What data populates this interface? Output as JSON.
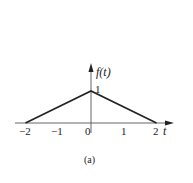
{
  "chart_data": {
    "type": "line",
    "title": "",
    "caption": "(a)",
    "xlabel": "t",
    "ylabel": "f(t)",
    "x": [
      -2,
      0,
      2
    ],
    "y": [
      0,
      1,
      0
    ],
    "series": [
      {
        "name": "f(t)",
        "x": [
          -2,
          0,
          2
        ],
        "y": [
          0,
          1,
          0
        ]
      }
    ],
    "x_ticks": [
      "-2",
      "-1",
      "0",
      "1",
      "2"
    ],
    "y_ticks": [
      "1"
    ],
    "xlim": [
      -2,
      2
    ],
    "ylim": [
      0,
      1
    ],
    "grid": false,
    "legend": "none",
    "annotations": [
      "1"
    ]
  },
  "labels": {
    "ylabel": "f(t)",
    "xlabel": "t",
    "peak_value": "1",
    "tick_m2": "−2",
    "tick_m1": "−1",
    "tick_0": "0",
    "tick_1": "1",
    "tick_2": "2",
    "caption": "(a)"
  },
  "colors": {
    "line": "#222222",
    "axis": "#555555",
    "background": "#ffffff"
  }
}
